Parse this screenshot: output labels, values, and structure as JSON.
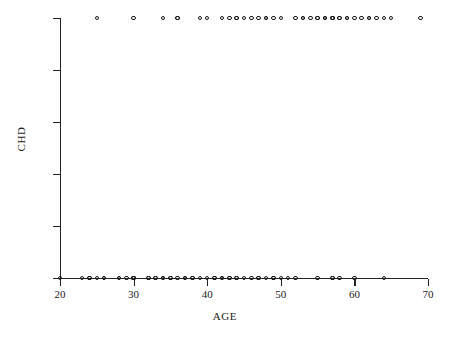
{
  "chart_data": {
    "type": "scatter",
    "title": "",
    "xlabel": "AGE",
    "ylabel": "CHD",
    "xlim": [
      20,
      70
    ],
    "ylim": [
      0,
      1
    ],
    "grid": false,
    "legend": null,
    "xticks": [
      20,
      30,
      40,
      50,
      60,
      70
    ],
    "xtick_labels": [
      "20",
      "30",
      "40",
      "50",
      "60",
      "70"
    ],
    "yticks": [
      0,
      0.2,
      0.4,
      0.6,
      0.8,
      1
    ],
    "ytick_labels": [
      "0",
      ".2",
      ".4",
      ".6",
      ".8",
      "1"
    ],
    "marker": "open-circle",
    "marker_color": "#1b1b1b",
    "n_points": 100,
    "series": [
      {
        "name": "CHD observations",
        "x": [
          20,
          23,
          24,
          24,
          25,
          25,
          26,
          26,
          28,
          28,
          29,
          30,
          30,
          30,
          30,
          30,
          30,
          32,
          32,
          33,
          33,
          34,
          34,
          34,
          34,
          35,
          35,
          36,
          36,
          36,
          37,
          37,
          37,
          38,
          38,
          39,
          39,
          40,
          40,
          41,
          41,
          42,
          42,
          42,
          42,
          43,
          43,
          43,
          44,
          44,
          44,
          44,
          45,
          45,
          46,
          46,
          47,
          47,
          47,
          48,
          48,
          48,
          49,
          49,
          49,
          50,
          50,
          51,
          52,
          52,
          53,
          53,
          54,
          55,
          55,
          55,
          56,
          56,
          56,
          57,
          57,
          57,
          57,
          57,
          57,
          58,
          58,
          58,
          59,
          59,
          60,
          60,
          61,
          62,
          62,
          63,
          64,
          64,
          65,
          69
        ],
        "y": [
          0,
          0,
          0,
          0,
          1,
          0,
          0,
          0,
          0,
          0,
          0,
          0,
          0,
          0,
          0,
          0,
          1,
          0,
          0,
          0,
          0,
          0,
          0,
          1,
          0,
          0,
          0,
          0,
          1,
          1,
          0,
          0,
          0,
          0,
          0,
          0,
          1,
          0,
          1,
          0,
          0,
          0,
          0,
          0,
          1,
          0,
          0,
          1,
          0,
          0,
          1,
          1,
          0,
          1,
          0,
          1,
          0,
          0,
          1,
          0,
          1,
          1,
          0,
          0,
          1,
          0,
          1,
          0,
          0,
          1,
          1,
          1,
          1,
          0,
          1,
          1,
          1,
          1,
          1,
          0,
          0,
          1,
          1,
          1,
          1,
          0,
          1,
          1,
          1,
          1,
          0,
          1,
          1,
          1,
          1,
          1,
          0,
          1,
          1,
          1
        ],
        "marker": "open-circle",
        "color": "#1b1b1b"
      }
    ]
  },
  "axes": {
    "x_title": "AGE",
    "y_title": "CHD"
  }
}
